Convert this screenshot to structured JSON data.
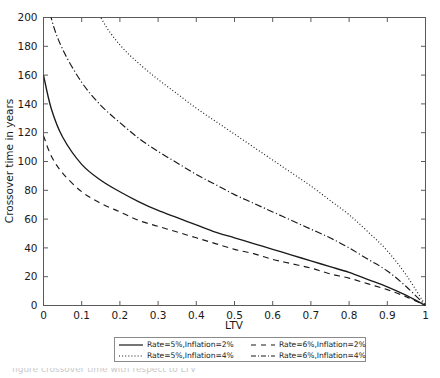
{
  "chart_data": {
    "type": "line",
    "title": "",
    "xlabel": "LTV",
    "ylabel": "Crossover time in years",
    "xlim": [
      0,
      1
    ],
    "ylim": [
      0,
      200
    ],
    "xticks": [
      "0",
      "0.1",
      "0.2",
      "0.3",
      "0.4",
      "0.5",
      "0.6",
      "0.7",
      "0.8",
      "0.9",
      "1"
    ],
    "yticks": [
      "0",
      "20",
      "40",
      "60",
      "80",
      "100",
      "120",
      "140",
      "160",
      "180",
      "200"
    ],
    "grid": false,
    "legend_position": "below-axes",
    "x": [
      0,
      0.02,
      0.05,
      0.1,
      0.15,
      0.2,
      0.25,
      0.3,
      0.35,
      0.4,
      0.45,
      0.5,
      0.55,
      0.6,
      0.65,
      0.7,
      0.75,
      0.8,
      0.85,
      0.9,
      0.95,
      1
    ],
    "series": [
      {
        "name": "Rate=5%,Inflation=2%",
        "style": "solid",
        "color": "#1a1a1a",
        "values": [
          160,
          137,
          117,
          98,
          87,
          79,
          72,
          66,
          61,
          56,
          51,
          47,
          43,
          39,
          35,
          31,
          27,
          23,
          18,
          13,
          7,
          0
        ]
      },
      {
        "name": "Rate=5%,Inflation=4%",
        "style": "dotted",
        "color": "#1a1a1a",
        "values": [
          340,
          305,
          268,
          231,
          200,
          181,
          168,
          157,
          147,
          137,
          128,
          119,
          110,
          101,
          92,
          83,
          73,
          63,
          51,
          38,
          21,
          0
        ]
      },
      {
        "name": "Rate=6%,Inflation=2%",
        "style": "dashed",
        "color": "#1a1a1a",
        "values": [
          118,
          104,
          92,
          79,
          71,
          65,
          59,
          55,
          51,
          47,
          43,
          39,
          36,
          32,
          29,
          26,
          22,
          19,
          15,
          11,
          6,
          0
        ]
      },
      {
        "name": "Rate=6%,Inflation=4%",
        "style": "dashdot",
        "color": "#1a1a1a",
        "values": [
          230,
          200,
          178,
          155,
          139,
          127,
          116,
          107,
          99,
          91,
          84,
          77,
          71,
          65,
          59,
          53,
          47,
          40,
          32,
          24,
          13,
          0
        ]
      }
    ]
  },
  "legend": {
    "entries": [
      {
        "label": "Rate=5%,Inflation=2%",
        "style": "solid"
      },
      {
        "label": "Rate=6%,Inflation=2%",
        "style": "dashed"
      },
      {
        "label": "Rate=5%,Inflation=4%",
        "style": "dotted"
      },
      {
        "label": "Rate=6%,Inflation=4%",
        "style": "dashdot"
      }
    ]
  },
  "caption": {
    "text": "figure    crossover time with respect to LTV"
  }
}
